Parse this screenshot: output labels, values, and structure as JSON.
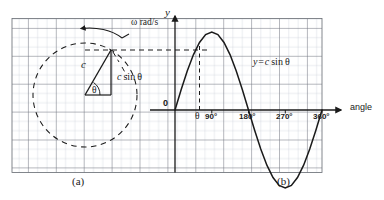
{
  "figure": {
    "panels": [
      {
        "id": "a",
        "caption": "(a)",
        "type": "rotating-vector-diagram",
        "labels": {
          "omega": "ω rad/s",
          "radius": "c",
          "projection": "c sin θ",
          "angle": "θ"
        },
        "circle": {
          "cx": 85,
          "cy": 95,
          "r": 52,
          "style": "dashed"
        },
        "vector_angle_deg": 60
      },
      {
        "id": "b",
        "caption": "(b)",
        "type": "line",
        "labels": {
          "y_axis": "y",
          "x_axis": "angle",
          "origin": "0",
          "curve": "y = c sin θ",
          "theta": "θ"
        },
        "x_ticks": [
          "90°",
          "180°",
          "270°",
          "360°"
        ]
      }
    ]
  },
  "chart_data": {
    "type": "line",
    "xlabel": "angle",
    "ylabel": "y",
    "x": [
      0,
      15,
      30,
      45,
      60,
      75,
      90,
      105,
      120,
      135,
      150,
      165,
      180,
      195,
      210,
      225,
      240,
      255,
      270,
      285,
      300,
      315,
      330,
      345,
      360
    ],
    "values": [
      0,
      0.259,
      0.5,
      0.707,
      0.866,
      0.966,
      1,
      0.966,
      0.866,
      0.707,
      0.5,
      0.259,
      0,
      -0.259,
      -0.5,
      -0.707,
      -0.866,
      -0.966,
      -1,
      -0.966,
      -0.866,
      -0.707,
      -0.5,
      -0.259,
      0
    ],
    "series": [
      {
        "name": "y = c sin θ",
        "values": [
          0,
          0.259,
          0.5,
          0.707,
          0.866,
          0.966,
          1,
          0.966,
          0.866,
          0.707,
          0.5,
          0.259,
          0,
          -0.259,
          -0.5,
          -0.707,
          -0.866,
          -0.966,
          -1,
          -0.966,
          -0.866,
          -0.707,
          -0.5,
          -0.259,
          0
        ]
      }
    ],
    "xlim": [
      -45,
      400
    ],
    "ylim": [
      -1.55,
      1.55
    ],
    "xtick_values": [
      90,
      180,
      270,
      360
    ],
    "xtick_labels": [
      "90°",
      "180°",
      "270°",
      "360°"
    ],
    "grid": true,
    "legend": "none",
    "annotations": [
      {
        "text": "y = c sin θ",
        "x": 225,
        "y": 0.72
      },
      {
        "text": "θ",
        "x": 60,
        "y": -0.12
      },
      {
        "text": "0",
        "x": -18,
        "y": 0.13
      }
    ],
    "amplitude_label": "c",
    "marker_angle_deg": 60,
    "marker_value": 0.866
  },
  "colors": {
    "curve": "#1a1a1a",
    "grid_minor": "#b9c0cc",
    "grid_major": "#6d7178",
    "axis": "#1a1a1a",
    "dashed": "#1a1a1a",
    "background": "#ffffff"
  }
}
